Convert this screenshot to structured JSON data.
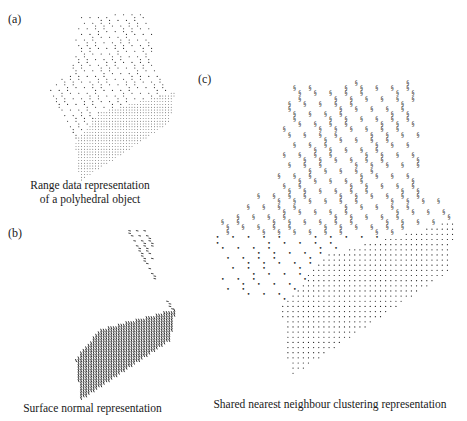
{
  "figure": {
    "panels": [
      {
        "id": "a",
        "label": "(a)",
        "caption_line1": "Range data representation",
        "caption_line2": "of a polyhedral object",
        "marker": "dot"
      },
      {
        "id": "b",
        "label": "(b)",
        "caption_line1": "Surface normal representation",
        "marker": "dash"
      },
      {
        "id": "c",
        "label": "(c)",
        "caption_line1": "Shared nearest neighbour clustering representation",
        "marker": "cluster-glyph"
      }
    ],
    "colors": {
      "ink": "#1a1a1a",
      "background": "#ffffff"
    }
  }
}
